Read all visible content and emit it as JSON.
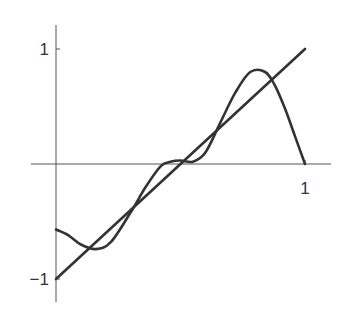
{
  "chart_data": {
    "type": "line",
    "title": "",
    "xlabel": "",
    "ylabel": "",
    "xlim": [
      0,
      1
    ],
    "ylim": [
      -1.15,
      1.2
    ],
    "grid": false,
    "legend": null,
    "x_ticks": [
      {
        "value": 1,
        "label": "1"
      }
    ],
    "y_ticks": [
      {
        "value": 1,
        "label": "1"
      },
      {
        "value": -1,
        "label": "-1"
      }
    ],
    "series": [
      {
        "name": "line",
        "x": [
          0,
          1
        ],
        "y": [
          -1,
          1
        ]
      },
      {
        "name": "oscillating-curve",
        "x": [
          0,
          0.05,
          0.1,
          0.16,
          0.22,
          0.3,
          0.36,
          0.42,
          0.46,
          0.5,
          0.55,
          0.6,
          0.66,
          0.72,
          0.78,
          0.84,
          0.88,
          0.92,
          0.96,
          1.0
        ],
        "y": [
          -0.57,
          -0.62,
          -0.7,
          -0.74,
          -0.68,
          -0.42,
          -0.2,
          -0.02,
          0.02,
          0.03,
          0.02,
          0.1,
          0.36,
          0.62,
          0.8,
          0.8,
          0.68,
          0.48,
          0.24,
          0.0
        ]
      }
    ]
  }
}
